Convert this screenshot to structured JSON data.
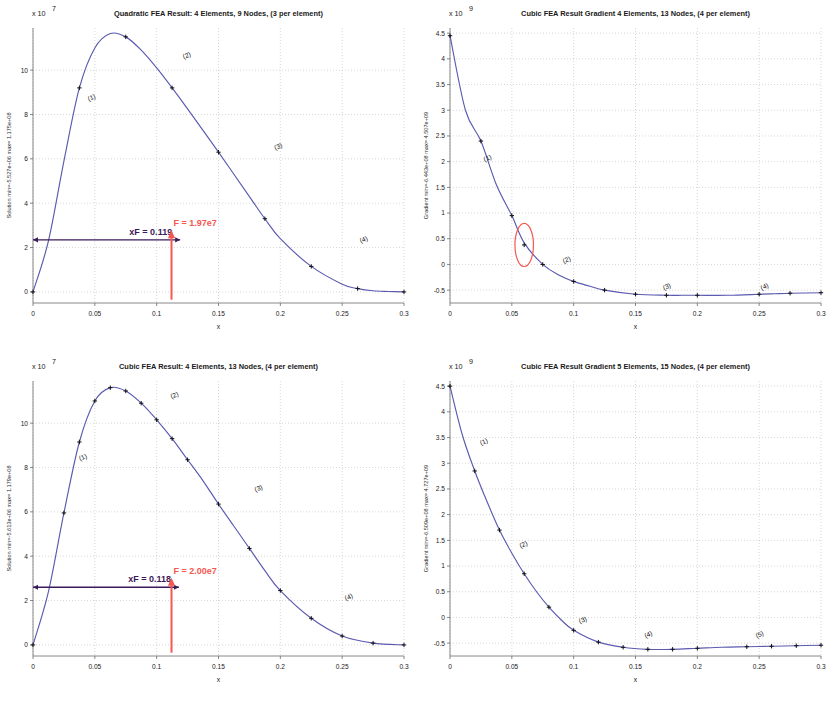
{
  "figure": {
    "width": 835,
    "height": 706,
    "background": "#ffffff",
    "curve_color": "#5a5ab0",
    "annotation_dark_color": "#3a1a5a",
    "annotation_red_color": "#f4584f",
    "grid_color": "#9a9a9a"
  },
  "panels": [
    {
      "id": "quadratic-solution",
      "position": "top-left",
      "title": "Quadratic FEA Result:  4 Elements, 9 Nodes,  (3 per element)",
      "exponent_label": "x 10",
      "exponent_power": "7",
      "ylabel": "Solution  min=-5.527e+06 max= 1.175e+08",
      "xlabel": "x",
      "xticks": [
        "0",
        "0.05",
        "0.1",
        "0.15",
        "0.2",
        "0.25",
        "0.3"
      ],
      "yticks": [
        "0",
        "2",
        "4",
        "6",
        "8",
        "10"
      ],
      "element_labels": [
        "(1)",
        "(2)",
        "(3)",
        "(4)"
      ],
      "annotations": {
        "xF_label": "xF = 0.119",
        "force_label": "F = 1.97e7"
      }
    },
    {
      "id": "cubic-gradient-4elem",
      "position": "top-right",
      "title": "Cubic FEA Result Gradient  4 Elements, 13 Nodes,  (4 per element)",
      "exponent_label": "x 10",
      "exponent_power": "9",
      "ylabel": "Gradient  min=-6.443e+08 max= 4.507e+09",
      "xlabel": "x",
      "xticks": [
        "0",
        "0.05",
        "0.1",
        "0.15",
        "0.2",
        "0.25",
        "0.3"
      ],
      "yticks": [
        "-0.5",
        "0",
        "0.5",
        "1",
        "1.5",
        "2",
        "2.5",
        "3",
        "3.5",
        "4",
        "4.5"
      ],
      "element_labels": [
        "(1)",
        "(2)",
        "(3)",
        "(4)"
      ],
      "annotations": {
        "highlight_ellipse": "red-ellipse-discontinuity"
      }
    },
    {
      "id": "cubic-solution",
      "position": "bottom-left",
      "title": "Cubic FEA Result:  4 Elements, 13 Nodes,  (4 per element)",
      "exponent_label": "x 10",
      "exponent_power": "7",
      "ylabel": "Solution  min=-5.613e+06 max= 1.179e+08",
      "xlabel": "x",
      "xticks": [
        "0",
        "0.05",
        "0.1",
        "0.15",
        "0.2",
        "0.25",
        "0.3"
      ],
      "yticks": [
        "0",
        "2",
        "4",
        "6",
        "8",
        "10"
      ],
      "element_labels": [
        "(1)",
        "(2)",
        "(3)",
        "(4)"
      ],
      "annotations": {
        "xF_label": "xF = 0.118",
        "force_label": "F = 2.00e7"
      }
    },
    {
      "id": "cubic-gradient-5elem",
      "position": "bottom-right",
      "title": "Cubic FEA Result Gradient  5 Elements, 15 Nodes,  (4 per element)",
      "exponent_label": "x 10",
      "exponent_power": "9",
      "ylabel": "Gradient  min=-6.509e+08 max= 4.727e+09",
      "xlabel": "x",
      "xticks": [
        "0",
        "0.05",
        "0.1",
        "0.15",
        "0.2",
        "0.25",
        "0.3"
      ],
      "yticks": [
        "-0.5",
        "0",
        "0.5",
        "1",
        "1.5",
        "2",
        "2.5",
        "3",
        "3.5",
        "4",
        "4.5"
      ],
      "element_labels": [
        "(1)",
        "(2)",
        "(3)",
        "(4)",
        "(5)"
      ]
    }
  ],
  "chart_data": [
    {
      "type": "line",
      "id": "quadratic-solution",
      "title": "Quadratic FEA Result:  4 Elements, 9 Nodes,  (3 per element)",
      "xlabel": "x",
      "ylabel": "Solution  min=-5.527e+06 max= 1.175e+08",
      "xlim": [
        0,
        0.3
      ],
      "ylim": [
        -0.5,
        11.9
      ],
      "y_scale": "x 10^7",
      "grid": true,
      "legend": "none",
      "x": [
        0,
        0.0125,
        0.025,
        0.0375,
        0.05,
        0.0625,
        0.075,
        0.0875,
        0.1,
        0.1125,
        0.125,
        0.15,
        0.175,
        0.1875,
        0.2,
        0.225,
        0.25,
        0.2625,
        0.275,
        0.2875,
        0.3
      ],
      "y": [
        0,
        2.3,
        5.9,
        9.2,
        11.0,
        11.65,
        11.5,
        10.9,
        10.1,
        9.2,
        8.25,
        6.3,
        4.3,
        3.3,
        2.4,
        1.15,
        0.35,
        0.15,
        0.05,
        0.02,
        0.0
      ],
      "node_markers_x": [
        0,
        0.0375,
        0.075,
        0.1125,
        0.15,
        0.1875,
        0.225,
        0.2625,
        0.3
      ],
      "node_markers_y": [
        0,
        9.2,
        11.5,
        9.2,
        6.3,
        3.3,
        1.15,
        0.15,
        0.0
      ],
      "element_label_positions": [
        {
          "label": "(1)",
          "x": 0.045,
          "y": 8.6
        },
        {
          "label": "(2)",
          "x": 0.122,
          "y": 10.5
        },
        {
          "label": "(3)",
          "x": 0.196,
          "y": 6.4
        },
        {
          "label": "(4)",
          "x": 0.265,
          "y": 2.2
        }
      ],
      "annotations": [
        {
          "text": "xF = 0.119",
          "type": "horizontal-arrow",
          "x_from": 0.0,
          "x_to": 0.119,
          "y": 2.35,
          "color": "#3a1a5a"
        },
        {
          "text": "F = 1.97e7",
          "type": "vertical-arrow",
          "x": 0.112,
          "y_from": -0.35,
          "y_to": 2.6,
          "color": "#f4584f"
        }
      ]
    },
    {
      "type": "line",
      "id": "cubic-gradient-4elem",
      "title": "Cubic FEA Result Gradient  4 Elements, 13 Nodes,  (4 per element)",
      "xlabel": "x",
      "ylabel": "Gradient  min=-6.443e+08 max= 4.507e+09",
      "xlim": [
        0,
        0.3
      ],
      "ylim": [
        -0.75,
        4.6
      ],
      "y_scale": "x 10^9",
      "grid": true,
      "legend": "none",
      "x": [
        0,
        0.0125,
        0.025,
        0.0375,
        0.05,
        0.06,
        0.075,
        0.0875,
        0.1,
        0.1125,
        0.125,
        0.15,
        0.175,
        0.1875,
        0.2,
        0.225,
        0.25,
        0.2625,
        0.275,
        0.3
      ],
      "y": [
        4.45,
        3.0,
        2.4,
        1.55,
        0.95,
        0.42,
        0.0,
        -0.2,
        -0.33,
        -0.42,
        -0.5,
        -0.58,
        -0.6,
        -0.6,
        -0.6,
        -0.6,
        -0.58,
        -0.57,
        -0.56,
        -0.55
      ],
      "node_markers_x": [
        0,
        0.025,
        0.05,
        0.06,
        0.075,
        0.1,
        0.125,
        0.15,
        0.175,
        0.2,
        0.25,
        0.275,
        0.3
      ],
      "node_markers_y": [
        4.45,
        2.4,
        0.95,
        0.38,
        0.0,
        -0.33,
        -0.5,
        -0.58,
        -0.6,
        -0.6,
        -0.58,
        -0.56,
        -0.55
      ],
      "element_label_positions": [
        {
          "label": "(1)",
          "x": 0.028,
          "y": 2.0
        },
        {
          "label": "(2)",
          "x": 0.092,
          "y": 0.02
        },
        {
          "label": "(3)",
          "x": 0.173,
          "y": -0.5
        },
        {
          "label": "(4)",
          "x": 0.252,
          "y": -0.5
        }
      ],
      "annotations": [
        {
          "type": "ellipse",
          "cx": 0.06,
          "cy": 0.38,
          "rx": 0.0075,
          "ry": 0.42,
          "color": "#f4584f",
          "name": "discontinuity-highlight"
        }
      ]
    },
    {
      "type": "line",
      "id": "cubic-solution",
      "title": "Cubic FEA Result:  4 Elements, 13 Nodes,  (4 per element)",
      "xlabel": "x",
      "ylabel": "Solution  min=-5.613e+06 max= 1.179e+08",
      "xlim": [
        0,
        0.3
      ],
      "ylim": [
        -0.5,
        11.9
      ],
      "y_scale": "x 10^7",
      "grid": true,
      "legend": "none",
      "x": [
        0,
        0.0125,
        0.025,
        0.0375,
        0.05,
        0.0625,
        0.075,
        0.0875,
        0.1,
        0.1125,
        0.125,
        0.1375,
        0.15,
        0.1625,
        0.175,
        0.1875,
        0.2,
        0.225,
        0.25,
        0.275,
        0.3
      ],
      "y": [
        0,
        2.4,
        5.95,
        9.15,
        11.0,
        11.6,
        11.45,
        10.9,
        10.15,
        9.3,
        8.35,
        7.4,
        6.35,
        5.35,
        4.35,
        3.35,
        2.45,
        1.2,
        0.4,
        0.08,
        0.0
      ],
      "node_markers_x": [
        0,
        0.025,
        0.0375,
        0.05,
        0.0625,
        0.075,
        0.0875,
        0.1,
        0.1125,
        0.125,
        0.15,
        0.175,
        0.2,
        0.225,
        0.25,
        0.275,
        0.3
      ],
      "node_markers_y": [
        0,
        5.95,
        9.15,
        11.0,
        11.6,
        11.45,
        10.9,
        10.15,
        9.3,
        8.35,
        6.35,
        4.35,
        2.45,
        1.2,
        0.4,
        0.08,
        0.0
      ],
      "element_label_positions": [
        {
          "label": "(1)",
          "x": 0.038,
          "y": 8.3
        },
        {
          "label": "(2)",
          "x": 0.112,
          "y": 11.1
        },
        {
          "label": "(3)",
          "x": 0.18,
          "y": 6.9
        },
        {
          "label": "(4)",
          "x": 0.253,
          "y": 2.0
        }
      ],
      "annotations": [
        {
          "text": "xF = 0.118",
          "type": "horizontal-arrow",
          "x_from": 0.0,
          "x_to": 0.118,
          "y": 2.6,
          "color": "#3a1a5a"
        },
        {
          "text": "F = 2.00e7",
          "type": "vertical-arrow",
          "x": 0.112,
          "y_from": -0.35,
          "y_to": 2.85,
          "color": "#f4584f"
        }
      ]
    },
    {
      "type": "line",
      "id": "cubic-gradient-5elem",
      "title": "Cubic FEA Result Gradient  5 Elements, 15 Nodes,  (4 per element)",
      "xlabel": "x",
      "ylabel": "Gradient  min=-6.509e+08 max= 4.727e+09",
      "xlim": [
        0,
        0.3
      ],
      "ylim": [
        -0.75,
        4.6
      ],
      "y_scale": "x 10^9",
      "grid": true,
      "legend": "none",
      "x": [
        0,
        0.01,
        0.02,
        0.03,
        0.04,
        0.05,
        0.06,
        0.07,
        0.08,
        0.09,
        0.1,
        0.12,
        0.14,
        0.16,
        0.18,
        0.2,
        0.22,
        0.24,
        0.26,
        0.28,
        0.3
      ],
      "y": [
        4.5,
        3.55,
        2.85,
        2.25,
        1.7,
        1.25,
        0.85,
        0.5,
        0.2,
        -0.05,
        -0.25,
        -0.48,
        -0.58,
        -0.62,
        -0.62,
        -0.6,
        -0.58,
        -0.57,
        -0.56,
        -0.55,
        -0.54
      ],
      "node_markers_x": [
        0,
        0.02,
        0.04,
        0.06,
        0.08,
        0.1,
        0.12,
        0.14,
        0.16,
        0.18,
        0.2,
        0.24,
        0.26,
        0.28,
        0.3
      ],
      "node_markers_y": [
        4.5,
        2.85,
        1.7,
        0.85,
        0.2,
        -0.25,
        -0.48,
        -0.58,
        -0.62,
        -0.62,
        -0.6,
        -0.57,
        -0.56,
        -0.55,
        -0.54
      ],
      "element_label_positions": [
        {
          "label": "(1)",
          "x": 0.025,
          "y": 3.35
        },
        {
          "label": "(2)",
          "x": 0.057,
          "y": 1.35
        },
        {
          "label": "(3)",
          "x": 0.105,
          "y": -0.12
        },
        {
          "label": "(4)",
          "x": 0.158,
          "y": -0.4
        },
        {
          "label": "(5)",
          "x": 0.248,
          "y": -0.4
        }
      ]
    }
  ]
}
